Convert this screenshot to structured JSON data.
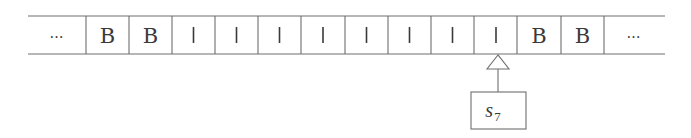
{
  "diagram": {
    "type": "turing-machine-tape",
    "tape": {
      "cells": [
        {
          "symbol": "…",
          "kind": "ellipsis"
        },
        {
          "symbol": "B",
          "kind": "blank"
        },
        {
          "symbol": "B",
          "kind": "blank"
        },
        {
          "symbol": "|",
          "kind": "stroke"
        },
        {
          "symbol": "|",
          "kind": "stroke"
        },
        {
          "symbol": "|",
          "kind": "stroke"
        },
        {
          "symbol": "|",
          "kind": "stroke"
        },
        {
          "symbol": "|",
          "kind": "stroke"
        },
        {
          "symbol": "|",
          "kind": "stroke"
        },
        {
          "symbol": "|",
          "kind": "stroke"
        },
        {
          "symbol": "|",
          "kind": "stroke"
        },
        {
          "symbol": "B",
          "kind": "blank"
        },
        {
          "symbol": "B",
          "kind": "blank"
        },
        {
          "symbol": "…",
          "kind": "ellipsis"
        }
      ],
      "head_position_index": 10
    },
    "head": {
      "state_letter": "s",
      "state_subscript": "7",
      "pointer_icon": "hollow-triangle-arrow"
    },
    "colors": {
      "line": "#6e6e6e",
      "text": "#3a3a3a",
      "background": "#ffffff"
    }
  }
}
